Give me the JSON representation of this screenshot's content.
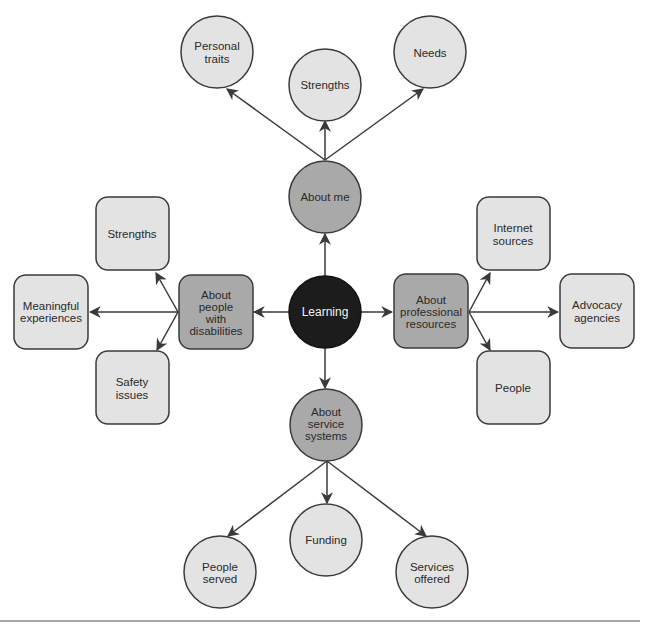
{
  "diagram": {
    "type": "mind-map",
    "colors": {
      "center": "#1c1c1c",
      "category": "#a9a9a9",
      "leaf": "#e3e3e3",
      "stroke": "#3a3a3a",
      "center_text": "#f2f2f2",
      "text": "#2a2a2a"
    },
    "center": {
      "id": "learning",
      "lines": [
        "Learning"
      ]
    },
    "categories": [
      {
        "id": "about-me",
        "shape": "circle",
        "lines": [
          "About me"
        ],
        "children": [
          {
            "shape": "circle",
            "lines": [
              "Personal",
              "traits"
            ]
          },
          {
            "shape": "circle",
            "lines": [
              "Strengths"
            ]
          },
          {
            "shape": "circle",
            "lines": [
              "Needs"
            ]
          }
        ]
      },
      {
        "id": "about-people",
        "shape": "rounded-box",
        "lines": [
          "About",
          "people",
          "with",
          "disabilities"
        ],
        "children": [
          {
            "shape": "rounded-box",
            "lines": [
              "Strengths"
            ]
          },
          {
            "shape": "rounded-box",
            "lines": [
              "Meaningful",
              "experiences"
            ]
          },
          {
            "shape": "rounded-box",
            "lines": [
              "Safety",
              "issues"
            ]
          }
        ]
      },
      {
        "id": "about-professional",
        "shape": "rounded-box",
        "lines": [
          "About",
          "professional",
          "resources"
        ],
        "children": [
          {
            "shape": "rounded-box",
            "lines": [
              "Internet",
              "sources"
            ]
          },
          {
            "shape": "rounded-box",
            "lines": [
              "Advocacy",
              "agencies"
            ]
          },
          {
            "shape": "rounded-box",
            "lines": [
              "People"
            ]
          }
        ]
      },
      {
        "id": "about-service",
        "shape": "circle",
        "lines": [
          "About",
          "service",
          "systems"
        ],
        "children": [
          {
            "shape": "circle",
            "lines": [
              "People",
              "served"
            ]
          },
          {
            "shape": "circle",
            "lines": [
              "Funding"
            ]
          },
          {
            "shape": "circle",
            "lines": [
              "Services",
              "offered"
            ]
          }
        ]
      }
    ]
  }
}
